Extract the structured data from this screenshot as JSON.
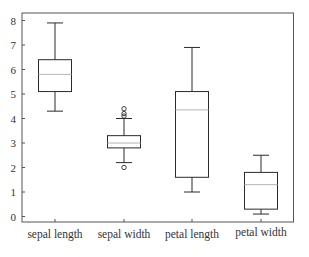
{
  "chart_data": {
    "type": "boxplot",
    "title": "",
    "xlabel": "",
    "ylabel": "",
    "ylim": [
      -0.2,
      8.4
    ],
    "yticks": [
      0,
      1,
      2,
      3,
      4,
      5,
      6,
      7,
      8
    ],
    "grid": false,
    "legend": null,
    "categories": [
      "sepal length",
      "sepal width",
      "petal length",
      "petal width"
    ],
    "series": [
      {
        "name": "sepal length",
        "whisker_low": 4.3,
        "q1": 5.1,
        "median": 5.8,
        "q3": 6.4,
        "whisker_high": 7.9,
        "outliers": []
      },
      {
        "name": "sepal width",
        "whisker_low": 2.2,
        "q1": 2.8,
        "median": 3.0,
        "q3": 3.3,
        "whisker_high": 4.0,
        "outliers": [
          4.4,
          4.2,
          4.1,
          2.0
        ]
      },
      {
        "name": "petal length",
        "whisker_low": 1.0,
        "q1": 1.6,
        "median": 4.35,
        "q3": 5.1,
        "whisker_high": 6.9,
        "outliers": []
      },
      {
        "name": "petal width",
        "whisker_low": 0.1,
        "q1": 0.3,
        "median": 1.3,
        "q3": 1.8,
        "whisker_high": 2.5,
        "outliers": []
      }
    ]
  },
  "style": {
    "box_color": "#2b2b2b",
    "median_color": "#b4b4b4",
    "frame_color": "#555555",
    "text_color": "#333333"
  }
}
